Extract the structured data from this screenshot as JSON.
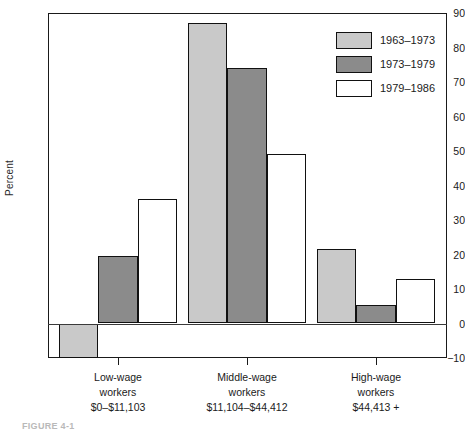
{
  "chart_data": {
    "type": "bar",
    "title": "",
    "xlabel": "",
    "ylabel": "Percent",
    "ylim": [
      -10,
      90
    ],
    "ytick_step": 10,
    "yticks": [
      90,
      80,
      70,
      60,
      50,
      40,
      30,
      20,
      10,
      0,
      -10
    ],
    "ytick_labels": [
      "90",
      "80",
      "70",
      "60",
      "50",
      "40",
      "30",
      "20",
      "10",
      "0",
      "−10"
    ],
    "grid": false,
    "legend_position": "top-right",
    "categories": [
      "Low-wage workers $0–$11,103",
      "Middle-wage workers $11,104–$44,412",
      "High-wage workers $44,413 +"
    ],
    "category_lines": [
      [
        "Low-wage",
        "workers",
        "$0–$11,103"
      ],
      [
        "Middle-wage",
        "workers",
        "$11,104–$44,412"
      ],
      [
        "High-wage",
        "workers",
        "$44,413 +"
      ]
    ],
    "series": [
      {
        "name": "1963–1973",
        "color": "#c9c9c9",
        "values": [
          -10,
          87,
          21.5
        ]
      },
      {
        "name": "1973–1979",
        "color": "#8b8b8b",
        "values": [
          19.5,
          74,
          5.5
        ]
      },
      {
        "name": "1979–1986",
        "color": "#ffffff",
        "values": [
          36,
          49,
          12.8
        ]
      }
    ]
  },
  "legend": {
    "items": [
      {
        "label": "1963–1973",
        "color": "#c9c9c9"
      },
      {
        "label": "1973–1979",
        "color": "#8b8b8b"
      },
      {
        "label": "1979–1986",
        "color": "#ffffff"
      }
    ]
  },
  "axis": {
    "y_title": "Percent"
  },
  "caption": {
    "fragment": "FIGURE 4-1"
  }
}
